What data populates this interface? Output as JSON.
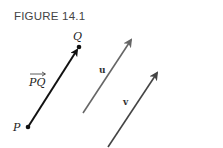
{
  "figure": {
    "title": "FIGURE 14.1",
    "labels": {
      "P": "P",
      "Q": "Q",
      "PQ": "PQ",
      "u": "u",
      "v": "v"
    },
    "colors": {
      "pq_vector": "#111111",
      "u_vector": "#666666",
      "v_vector": "#444444"
    }
  }
}
